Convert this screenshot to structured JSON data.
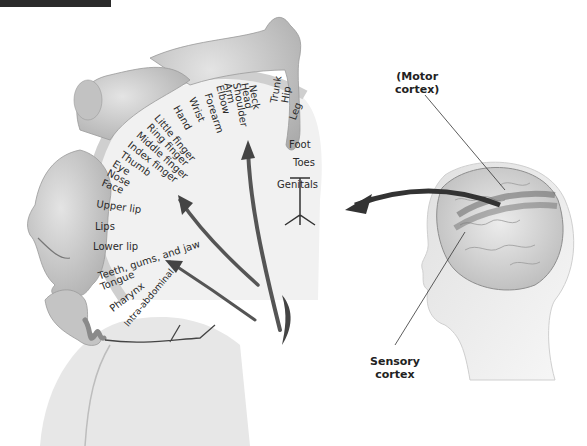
{
  "figure": {
    "type": "cortical homunculus diagram",
    "callouts": {
      "motor_cortex": "(Motor\ncortex)",
      "motor_cortex_line1": "(Motor",
      "motor_cortex_line2": "cortex)",
      "sensory_cortex_line1": "Sensory",
      "sensory_cortex_line2": "cortex"
    },
    "body_part_labels": [
      "Genitals",
      "Toes",
      "Foot",
      "Leg",
      "Hip",
      "Trunk",
      "Neck",
      "Head",
      "Shoulder",
      "Arm",
      "Elbow",
      "Forearm",
      "Wrist",
      "Hand",
      "Little finger",
      "Ring finger",
      "Middle finger",
      "Index finger",
      "Thumb",
      "Eye",
      "Nose",
      "Face",
      "Upper lip",
      "Lips",
      "Lower lip",
      "Teeth, gums, and jaw",
      "Tongue",
      "Pharynx",
      "Intra-abdominal"
    ],
    "colors": {
      "background": "#ffffff",
      "ink": "#2a2a2a",
      "skin": "#c9c9c9",
      "cortex": "#e6e6e6",
      "arrow": "#4a4a4a"
    }
  }
}
